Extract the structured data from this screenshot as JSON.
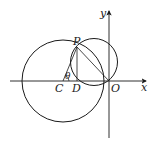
{
  "figure": {
    "type": "geometry",
    "axes": {
      "x_label": "x",
      "y_label": "y",
      "origin_label": "O"
    },
    "points": [
      {
        "id": "C",
        "label": "C"
      },
      {
        "id": "D",
        "label": "D"
      },
      {
        "id": "O",
        "label": "O"
      },
      {
        "id": "P",
        "label": "P"
      }
    ],
    "angle_label": "θ",
    "circles": [
      {
        "name": "circle-C",
        "center": "C",
        "passes_through": [
          "P"
        ]
      },
      {
        "name": "circle-small",
        "passes_through": [
          "P",
          "O"
        ]
      }
    ],
    "segments": [
      "CP",
      "PD",
      "PO"
    ],
    "colors": {
      "stroke": "#1a1a1a",
      "background": "#ffffff"
    }
  }
}
